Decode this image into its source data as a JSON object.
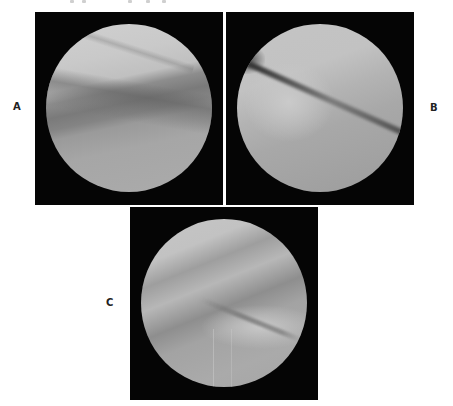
{
  "figure": {
    "panels": [
      {
        "id": "A",
        "label": "A",
        "description": "arthroscopic view, circular field"
      },
      {
        "id": "B",
        "label": "B",
        "description": "arthroscopic view, circular field"
      },
      {
        "id": "C",
        "label": "C",
        "description": "arthroscopic view, circular field"
      }
    ],
    "colors": {
      "background": "#ffffff",
      "panel_frame": "#050505",
      "label_text": "#222222"
    }
  }
}
